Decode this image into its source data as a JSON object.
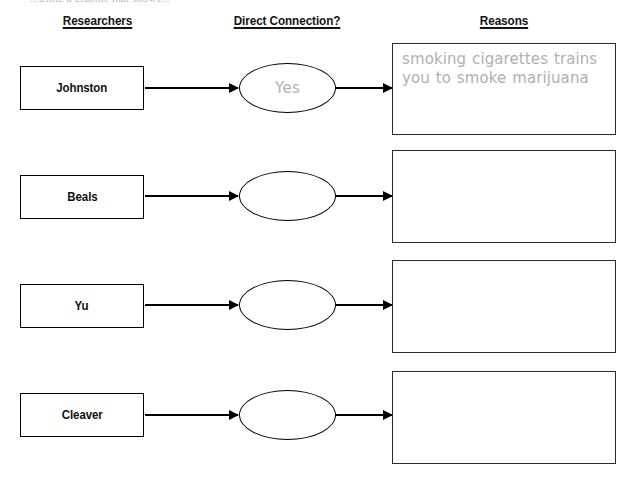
{
  "page": {
    "clipped_instruction": "...using a graphic that shows...",
    "background_color": "#ffffff",
    "ink_color": "#000000",
    "answer_ink_color": "#b0b0b0"
  },
  "headers": {
    "researchers": "Researchers",
    "connection": "Direct Connection?",
    "reasons": "Reasons"
  },
  "rows": [
    {
      "researcher": "Johnston",
      "connection": "Yes",
      "reasons": "smoking cigarettes trains you to smoke marijuana"
    },
    {
      "researcher": "Beals",
      "connection": "",
      "reasons": ""
    },
    {
      "researcher": "Yu",
      "connection": "",
      "reasons": ""
    },
    {
      "researcher": "Cleaver",
      "connection": "",
      "reasons": ""
    }
  ]
}
